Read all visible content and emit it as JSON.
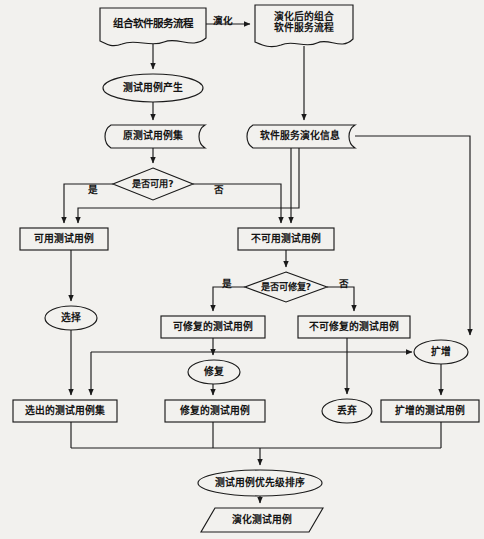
{
  "diagram": {
    "language": "zh",
    "stroke_color": "#1a1a1a",
    "fill_color": "#f2f1ee",
    "background": "#f2f1ee",
    "nodes": [
      {
        "id": "n1",
        "shape": "document",
        "label": "组合软件服务流程",
        "x": 100,
        "y": 8,
        "w": 106,
        "h": 38
      },
      {
        "id": "n2",
        "shape": "document",
        "label": "演化后的组合\n软件服务流程",
        "x": 255,
        "y": 5,
        "w": 98,
        "h": 42
      },
      {
        "id": "n3",
        "shape": "ellipse",
        "label": "测试用例产生",
        "x": 103,
        "y": 74,
        "w": 100,
        "h": 28
      },
      {
        "id": "n4",
        "shape": "stored",
        "label": "原测试用例集",
        "x": 101,
        "y": 125,
        "w": 104,
        "h": 23
      },
      {
        "id": "n5",
        "shape": "stored",
        "label": "软件服务演化信息",
        "x": 243,
        "y": 125,
        "w": 112,
        "h": 23
      },
      {
        "id": "n6",
        "shape": "diamond",
        "label": "是否可用?",
        "x": 113,
        "y": 168,
        "w": 80,
        "h": 32
      },
      {
        "id": "n7",
        "shape": "rect",
        "label": "可用测试用例",
        "x": 20,
        "y": 228,
        "w": 88,
        "h": 22
      },
      {
        "id": "n8",
        "shape": "rect",
        "label": "不可用测试用例",
        "x": 238,
        "y": 228,
        "w": 96,
        "h": 22
      },
      {
        "id": "n9",
        "shape": "diamond",
        "label": "是否可修复?",
        "x": 245,
        "y": 272,
        "w": 82,
        "h": 30
      },
      {
        "id": "n10",
        "shape": "ellipse",
        "label": "选择",
        "x": 45,
        "y": 306,
        "w": 52,
        "h": 24
      },
      {
        "id": "n11",
        "shape": "rect",
        "label": "可修复的测试用例",
        "x": 161,
        "y": 316,
        "w": 104,
        "h": 22
      },
      {
        "id": "n12",
        "shape": "rect",
        "label": "不可修复的测试用例",
        "x": 298,
        "y": 316,
        "w": 112,
        "h": 22
      },
      {
        "id": "n13",
        "shape": "ellipse",
        "label": "扩增",
        "x": 414,
        "y": 340,
        "w": 54,
        "h": 24
      },
      {
        "id": "n14",
        "shape": "ellipse",
        "label": "修复",
        "x": 188,
        "y": 360,
        "w": 52,
        "h": 24
      },
      {
        "id": "n15",
        "shape": "rect",
        "label": "选出的测试用例集",
        "x": 13,
        "y": 400,
        "w": 104,
        "h": 22
      },
      {
        "id": "n16",
        "shape": "rect",
        "label": "修复的测试用例",
        "x": 165,
        "y": 400,
        "w": 100,
        "h": 22
      },
      {
        "id": "n17",
        "shape": "ellipse",
        "label": "丢弃",
        "x": 322,
        "y": 399,
        "w": 50,
        "h": 24
      },
      {
        "id": "n18",
        "shape": "rect",
        "label": "扩增的测试用例",
        "x": 381,
        "y": 400,
        "w": 98,
        "h": 22
      },
      {
        "id": "n19",
        "shape": "ellipse",
        "label": "测试用例优先级排序",
        "x": 198,
        "y": 470,
        "w": 124,
        "h": 26
      },
      {
        "id": "n20",
        "shape": "parallelogram",
        "label": "演化测试用例",
        "x": 201,
        "y": 508,
        "w": 122,
        "h": 24
      }
    ],
    "edge_labels": [
      {
        "text": "演化",
        "x": 213,
        "y": 13
      },
      {
        "text": "是",
        "x": 88,
        "y": 182
      },
      {
        "text": "否",
        "x": 214,
        "y": 182
      },
      {
        "text": "是",
        "x": 222,
        "y": 276
      },
      {
        "text": "否",
        "x": 339,
        "y": 276
      }
    ],
    "edges": [
      {
        "from": "组合软件服务流程",
        "to": "演化后的组合软件服务流程",
        "label": "演化"
      },
      {
        "from": "组合软件服务流程",
        "to": "测试用例产生",
        "label": ""
      },
      {
        "from": "测试用例产生",
        "to": "原测试用例集",
        "label": ""
      },
      {
        "from": "演化后的组合软件服务流程",
        "to": "软件服务演化信息",
        "label": ""
      },
      {
        "from": "原测试用例集",
        "to": "是否可用?",
        "label": ""
      },
      {
        "from": "是否可用?",
        "to": "可用测试用例",
        "label": "是"
      },
      {
        "from": "是否可用?",
        "to": "不可用测试用例",
        "label": "否"
      },
      {
        "from": "软件服务演化信息",
        "to": "可用测试用例",
        "label": ""
      },
      {
        "from": "软件服务演化信息",
        "to": "不可用测试用例",
        "label": ""
      },
      {
        "from": "软件服务演化信息",
        "to": "扩增",
        "label": ""
      },
      {
        "from": "可用测试用例",
        "to": "选择",
        "label": ""
      },
      {
        "from": "选择",
        "to": "选出的测试用例集",
        "label": ""
      },
      {
        "from": "不可用测试用例",
        "to": "是否可修复?",
        "label": ""
      },
      {
        "from": "是否可修复?",
        "to": "可修复的测试用例",
        "label": "是"
      },
      {
        "from": "是否可修复?",
        "to": "不可修复的测试用例",
        "label": "否"
      },
      {
        "from": "可修复的测试用例",
        "to": "修复",
        "label": ""
      },
      {
        "from": "可修复的测试用例",
        "to": "扩增",
        "label": ""
      },
      {
        "from": "不可修复的测试用例",
        "to": "丢弃",
        "label": ""
      },
      {
        "from": "修复",
        "to": "修复的测试用例",
        "label": ""
      },
      {
        "from": "扩增",
        "to": "扩增的测试用例",
        "label": ""
      },
      {
        "from": "选出的测试用例集",
        "to": "测试用例优先级排序",
        "label": ""
      },
      {
        "from": "修复的测试用例",
        "to": "测试用例优先级排序",
        "label": ""
      },
      {
        "from": "扩增的测试用例",
        "to": "测试用例优先级排序",
        "label": ""
      },
      {
        "from": "测试用例优先级排序",
        "to": "演化测试用例",
        "label": ""
      }
    ]
  }
}
